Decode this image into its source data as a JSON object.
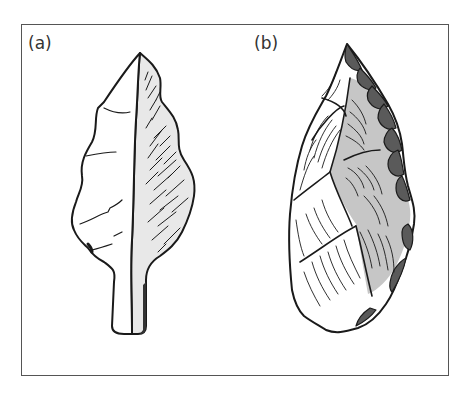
{
  "figure": {
    "panels": [
      {
        "id": "a",
        "label": "(a)",
        "subject": "tanged leaf-shaped stone point, two faces (plain left face, hatched shaded right face)"
      },
      {
        "id": "b",
        "label": "(b)",
        "subject": "stone scraper/point with flake scars, dark retouched right edge"
      }
    ],
    "colors": {
      "outline": "#1a1a1a",
      "light_face": "#ffffff",
      "shaded_face": "#e6e6e6",
      "mid_shade": "#c4c4c4",
      "dark_retouch": "#555555",
      "frame": "#555555"
    }
  }
}
